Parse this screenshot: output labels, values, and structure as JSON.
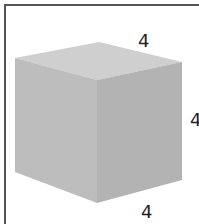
{
  "diagram": {
    "shape": "cube",
    "colors": {
      "top_face": "#cfcfcf",
      "left_face": "#bdbdbd",
      "right_face": "#b3b3b3",
      "frame": "#555555",
      "label": "#222222"
    },
    "labels": {
      "top_edge": "4",
      "right_edge": "4",
      "bottom_edge": "4"
    }
  }
}
